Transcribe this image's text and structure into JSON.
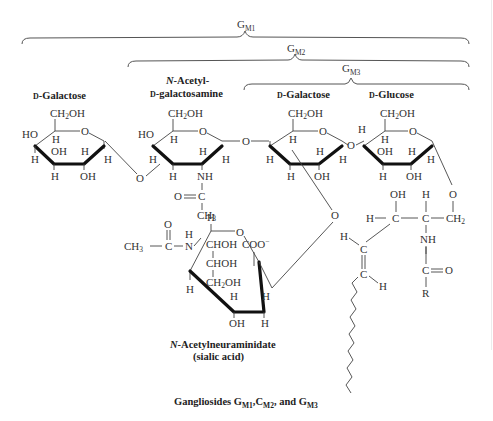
{
  "brackets": [
    {
      "label": "G",
      "subscript": "M1"
    },
    {
      "label": "G",
      "subscript": "M2"
    },
    {
      "label": "G",
      "subscript": "M3"
    }
  ],
  "residues": {
    "galactose_terminal": {
      "name_prefix": "D",
      "name": "-Galactose"
    },
    "galnac": {
      "line1_prefix": "N",
      "line1": "-Acetyl-",
      "line2_prefix": "D",
      "line2": "-galactosamine"
    },
    "galactose_inner": {
      "name_prefix": "D",
      "name": "-Galactose"
    },
    "glucose": {
      "name_prefix": "D",
      "name": "-Glucose"
    },
    "sialic": {
      "line1_prefix": "N",
      "line1": "-Acetylneuraminidate",
      "line2": "(sialic acid)"
    }
  },
  "atoms": {
    "ch2oh": "CH",
    "ch2oh_sub": "2",
    "ch2oh_end": "OH",
    "ho": "HO",
    "oh": "OH",
    "h": "H",
    "o": "O",
    "nh": "NH",
    "n": "N",
    "c": "C",
    "r": "R",
    "ch3": "CH",
    "ch3_sub": "3",
    "ch2": "CH",
    "ch2_sub": "2",
    "o_eq_c": "O═C",
    "c_eq_o": "C═O",
    "chohlabel": "CHOH",
    "coo": "COO",
    "coo_sup": "−"
  },
  "caption": {
    "prefix": "Gangliosides ",
    "g": "G",
    "m1": "M1",
    "sep1": ",C",
    "m2": "M2",
    "sep2": ", and G",
    "m3": "M3"
  }
}
